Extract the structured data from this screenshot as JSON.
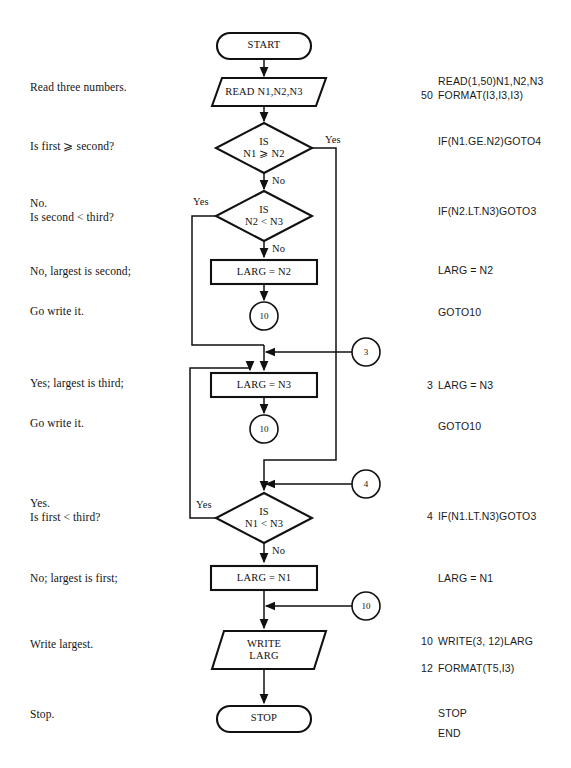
{
  "document": {
    "title": "Flowchart: find largest of three numbers (FORTRAN)",
    "background_color": "#ffffff",
    "ink_color": "#111111"
  },
  "left_annotations": [
    {
      "id": "read-three-numbers",
      "text": "Read three numbers.",
      "x": 30,
      "y": 87
    },
    {
      "id": "is-first-ge-second",
      "text": "Is first ⩾ second?",
      "x": 30,
      "y": 146
    },
    {
      "id": "is-second-lt-third",
      "text": "No.\nIs second < third?",
      "x": 30,
      "y": 203
    },
    {
      "id": "largest-is-second",
      "text": "No, largest is second;",
      "x": 30,
      "y": 271
    },
    {
      "id": "go-write-it-1",
      "text": "Go write it.",
      "x": 30,
      "y": 311
    },
    {
      "id": "largest-is-third",
      "text": "Yes; largest is third;",
      "x": 30,
      "y": 383
    },
    {
      "id": "go-write-it-2",
      "text": "Go write it.",
      "x": 30,
      "y": 423
    },
    {
      "id": "is-first-lt-third",
      "text": "Yes.\nIs first < third?",
      "x": 30,
      "y": 503
    },
    {
      "id": "largest-is-first",
      "text": "No; largest is first;",
      "x": 30,
      "y": 578
    },
    {
      "id": "write-largest",
      "text": "Write largest.",
      "x": 30,
      "y": 644
    },
    {
      "id": "stop-note",
      "text": "Stop.",
      "x": 30,
      "y": 714
    }
  ],
  "code_lines": [
    {
      "id": "read-stmt",
      "label": "",
      "text": "READ(1,50)N1,N2,N3",
      "x": 438,
      "y": 81,
      "num_x": 415
    },
    {
      "id": "format-50",
      "label": "50",
      "text": "FORMAT(I3,I3,I3)",
      "x": 438,
      "y": 95,
      "num_x": 415
    },
    {
      "id": "if-n1-ge-n2",
      "label": "",
      "text": "IF(N1.GE.N2)GOTO4",
      "x": 438,
      "y": 141,
      "num_x": 415
    },
    {
      "id": "if-n2-lt-n3",
      "label": "",
      "text": "IF(N2.LT.N3)GOTO3",
      "x": 438,
      "y": 211,
      "num_x": 415
    },
    {
      "id": "larg-n2",
      "label": "",
      "text": "LARG = N2",
      "x": 438,
      "y": 270,
      "num_x": 415
    },
    {
      "id": "goto10-a",
      "label": "",
      "text": "GOTO10",
      "x": 438,
      "y": 312,
      "num_x": 415
    },
    {
      "id": "larg-n3",
      "label": "3",
      "text": "LARG = N3",
      "x": 438,
      "y": 385,
      "num_x": 415
    },
    {
      "id": "goto10-b",
      "label": "",
      "text": "GOTO10",
      "x": 438,
      "y": 426,
      "num_x": 415
    },
    {
      "id": "if-n1-lt-n3",
      "label": "4",
      "text": "IF(N1.LT.N3)GOTO3",
      "x": 438,
      "y": 516,
      "num_x": 415
    },
    {
      "id": "larg-n1",
      "label": "",
      "text": "LARG = N1",
      "x": 438,
      "y": 578,
      "num_x": 415
    },
    {
      "id": "write-stmt",
      "label": "10",
      "text": "WRITE(3, 12)LARG",
      "x": 438,
      "y": 641,
      "num_x": 415
    },
    {
      "id": "format-12",
      "label": "12",
      "text": "FORMAT(T5,I3)",
      "x": 438,
      "y": 668,
      "num_x": 415
    },
    {
      "id": "stop-stmt",
      "label": "",
      "text": "STOP",
      "x": 438,
      "y": 713,
      "num_x": 415
    },
    {
      "id": "end-stmt",
      "label": "",
      "text": "END",
      "x": 438,
      "y": 733,
      "num_x": 415
    }
  ],
  "nodes": {
    "start": {
      "type": "terminator",
      "text": "START",
      "cx": 264,
      "cy": 46,
      "w": 94,
      "h": 26
    },
    "read": {
      "type": "io",
      "text": "READ N1,N2,N3",
      "cx": 264,
      "cy": 92,
      "w": 124,
      "h": 28
    },
    "dec_ge": {
      "type": "decision",
      "text": "IS\nN1 ⩾ N2",
      "cx": 264,
      "cy": 148,
      "w": 96,
      "h": 50
    },
    "dec_n2n3": {
      "type": "decision",
      "text": "IS\nN2 < N3",
      "cx": 264,
      "cy": 216,
      "w": 96,
      "h": 50
    },
    "larg_n2": {
      "type": "process",
      "text": "LARG = N2",
      "cx": 264,
      "cy": 272,
      "w": 106,
      "h": 24
    },
    "conn_10_a": {
      "type": "connector",
      "text": "10",
      "cx": 264,
      "cy": 316,
      "r": 14
    },
    "conn_3": {
      "type": "connector",
      "text": "3",
      "cx": 366,
      "cy": 352,
      "r": 14
    },
    "larg_n3": {
      "type": "process",
      "text": "LARG = N3",
      "cx": 264,
      "cy": 385,
      "w": 106,
      "h": 24
    },
    "conn_10_b": {
      "type": "connector",
      "text": "10",
      "cx": 264,
      "cy": 429,
      "r": 14
    },
    "conn_4": {
      "type": "connector",
      "text": "4",
      "cx": 366,
      "cy": 484,
      "r": 14
    },
    "dec_n1n3": {
      "type": "decision",
      "text": "IS\nN1 < N3",
      "cx": 264,
      "cy": 518,
      "w": 96,
      "h": 50
    },
    "larg_n1": {
      "type": "process",
      "text": "LARG = N1",
      "cx": 264,
      "cy": 578,
      "w": 106,
      "h": 24
    },
    "conn_10_c": {
      "type": "connector",
      "text": "10",
      "cx": 366,
      "cy": 606,
      "r": 14
    },
    "write": {
      "type": "io",
      "text": "WRITE\nLARG",
      "cx": 264,
      "cy": 650,
      "w": 104,
      "h": 38
    },
    "stop": {
      "type": "terminator",
      "text": "STOP",
      "cx": 264,
      "cy": 719,
      "w": 94,
      "h": 26
    }
  },
  "edge_labels": [
    {
      "id": "yes-ge",
      "text": "Yes",
      "x": 325,
      "y": 134
    },
    {
      "id": "no-ge",
      "text": "No",
      "x": 272,
      "y": 183
    },
    {
      "id": "yes-n2n3",
      "text": "Yes",
      "x": 193,
      "y": 198
    },
    {
      "id": "no-n2n3",
      "text": "No",
      "x": 272,
      "y": 249
    },
    {
      "id": "yes-n1n3",
      "text": "Yes",
      "x": 196,
      "y": 503
    },
    {
      "id": "no-n1n3",
      "text": "No",
      "x": 272,
      "y": 551
    }
  ]
}
